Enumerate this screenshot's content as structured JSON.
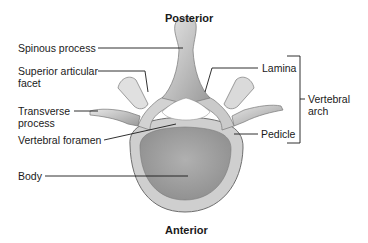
{
  "orientation": {
    "top": "Posterior",
    "bottom": "Anterior"
  },
  "labels": {
    "spinous_process": "Spinous process",
    "superior_articular_facet_line1": "Superior articular",
    "superior_articular_facet_line2": "facet",
    "transverse_process_line1": "Transverse",
    "transverse_process_line2": "process",
    "vertebral_foramen": "Vertebral foramen",
    "body": "Body",
    "lamina": "Lamina",
    "pedicle": "Pedicle",
    "vertebral_arch_line1": "Vertebral",
    "vertebral_arch_line2": "arch"
  },
  "colors": {
    "bone_light": "#d9d9d9",
    "bone_mid": "#b5b5b5",
    "bone_dark": "#8a8a8a",
    "body_inner": "#a8a8a8",
    "leader_line": "#1a1a1a"
  }
}
